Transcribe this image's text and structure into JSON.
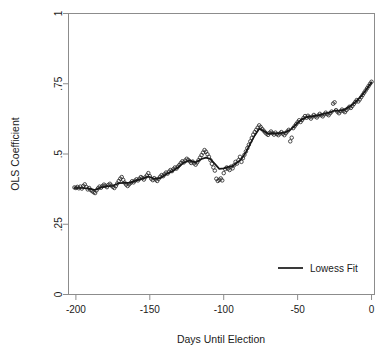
{
  "chart_data": {
    "type": "scatter",
    "title": "",
    "xlabel": "Days Until Election",
    "ylabel": "OLS Coefficient",
    "xlim": [
      -205,
      2
    ],
    "ylim": [
      0,
      1
    ],
    "xticks": [
      -200,
      -150,
      -100,
      -50,
      0
    ],
    "xticklabels": [
      "-200",
      "-150",
      "-100",
      "-50",
      "0"
    ],
    "yticks": [
      0,
      0.25,
      0.5,
      0.75,
      1
    ],
    "yticklabels": [
      "0",
      ".25",
      ".5",
      ".75",
      "1"
    ],
    "grid": false,
    "legend": {
      "position": "bottom-right",
      "entries": [
        {
          "label": "Lowess Fit",
          "marker": "line",
          "color": "#171717"
        }
      ]
    },
    "series": [
      {
        "name": "OLS coefficient estimates",
        "type": "scatter",
        "marker": "open-circle",
        "color": "#2b2b2b",
        "points": [
          [
            -201,
            0.381
          ],
          [
            -200,
            0.379
          ],
          [
            -199,
            0.383
          ],
          [
            -198,
            0.378
          ],
          [
            -197,
            0.384
          ],
          [
            -196,
            0.377
          ],
          [
            -195,
            0.386
          ],
          [
            -194,
            0.392
          ],
          [
            -193,
            0.383
          ],
          [
            -192,
            0.374
          ],
          [
            -191,
            0.379
          ],
          [
            -190,
            0.372
          ],
          [
            -189,
            0.368
          ],
          [
            -188,
            0.364
          ],
          [
            -187,
            0.361
          ],
          [
            -186,
            0.371
          ],
          [
            -185,
            0.378
          ],
          [
            -184,
            0.384
          ],
          [
            -183,
            0.38
          ],
          [
            -182,
            0.386
          ],
          [
            -181,
            0.391
          ],
          [
            -180,
            0.387
          ],
          [
            -179,
            0.382
          ],
          [
            -178,
            0.39
          ],
          [
            -177,
            0.394
          ],
          [
            -176,
            0.388
          ],
          [
            -175,
            0.383
          ],
          [
            -174,
            0.379
          ],
          [
            -173,
            0.386
          ],
          [
            -172,
            0.395
          ],
          [
            -171,
            0.404
          ],
          [
            -170,
            0.412
          ],
          [
            -169,
            0.418
          ],
          [
            -168,
            0.408
          ],
          [
            -167,
            0.398
          ],
          [
            -166,
            0.391
          ],
          [
            -165,
            0.386
          ],
          [
            -164,
            0.392
          ],
          [
            -163,
            0.397
          ],
          [
            -162,
            0.403
          ],
          [
            -161,
            0.399
          ],
          [
            -160,
            0.405
          ],
          [
            -159,
            0.41
          ],
          [
            -158,
            0.406
          ],
          [
            -157,
            0.412
          ],
          [
            -156,
            0.418
          ],
          [
            -155,
            0.414
          ],
          [
            -154,
            0.409
          ],
          [
            -153,
            0.417
          ],
          [
            -152,
            0.424
          ],
          [
            -151,
            0.432
          ],
          [
            -150,
            0.421
          ],
          [
            -149,
            0.412
          ],
          [
            -148,
            0.407
          ],
          [
            -147,
            0.414
          ],
          [
            -146,
            0.409
          ],
          [
            -145,
            0.404
          ],
          [
            -144,
            0.412
          ],
          [
            -143,
            0.419
          ],
          [
            -142,
            0.425
          ],
          [
            -141,
            0.421
          ],
          [
            -140,
            0.428
          ],
          [
            -139,
            0.434
          ],
          [
            -138,
            0.43
          ],
          [
            -137,
            0.437
          ],
          [
            -136,
            0.443
          ],
          [
            -135,
            0.439
          ],
          [
            -134,
            0.446
          ],
          [
            -133,
            0.452
          ],
          [
            -132,
            0.448
          ],
          [
            -131,
            0.455
          ],
          [
            -130,
            0.461
          ],
          [
            -129,
            0.468
          ],
          [
            -128,
            0.474
          ],
          [
            -127,
            0.47
          ],
          [
            -126,
            0.477
          ],
          [
            -125,
            0.483
          ],
          [
            -124,
            0.479
          ],
          [
            -123,
            0.474
          ],
          [
            -122,
            0.468
          ],
          [
            -121,
            0.473
          ],
          [
            -120,
            0.467
          ],
          [
            -119,
            0.462
          ],
          [
            -118,
            0.47
          ],
          [
            -117,
            0.478
          ],
          [
            -116,
            0.487
          ],
          [
            -115,
            0.496
          ],
          [
            -114,
            0.505
          ],
          [
            -113,
            0.514
          ],
          [
            -112,
            0.508
          ],
          [
            -111,
            0.499
          ],
          [
            -110,
            0.49
          ],
          [
            -109,
            0.478
          ],
          [
            -108,
            0.465
          ],
          [
            -107,
            0.452
          ],
          [
            -106,
            0.441
          ],
          [
            -105,
            0.412
          ],
          [
            -104,
            0.404
          ],
          [
            -103,
            0.408
          ],
          [
            -102,
            0.413
          ],
          [
            -101,
            0.406
          ],
          [
            -100,
            0.432
          ],
          [
            -99,
            0.446
          ],
          [
            -98,
            0.452
          ],
          [
            -97,
            0.448
          ],
          [
            -96,
            0.443
          ],
          [
            -95,
            0.455
          ],
          [
            -94,
            0.449
          ],
          [
            -93,
            0.46
          ],
          [
            -92,
            0.472
          ],
          [
            -91,
            0.466
          ],
          [
            -90,
            0.478
          ],
          [
            -89,
            0.49
          ],
          [
            -88,
            0.472
          ],
          [
            -87,
            0.485
          ],
          [
            -86,
            0.497
          ],
          [
            -85,
            0.509
          ],
          [
            -84,
            0.521
          ],
          [
            -83,
            0.533
          ],
          [
            -82,
            0.545
          ],
          [
            -81,
            0.557
          ],
          [
            -80,
            0.569
          ],
          [
            -79,
            0.578
          ],
          [
            -78,
            0.586
          ],
          [
            -77,
            0.594
          ],
          [
            -76,
            0.602
          ],
          [
            -75,
            0.596
          ],
          [
            -74,
            0.589
          ],
          [
            -73,
            0.583
          ],
          [
            -72,
            0.577
          ],
          [
            -71,
            0.572
          ],
          [
            -70,
            0.568
          ],
          [
            -69,
            0.575
          ],
          [
            -68,
            0.58
          ],
          [
            -67,
            0.574
          ],
          [
            -66,
            0.569
          ],
          [
            -65,
            0.576
          ],
          [
            -64,
            0.571
          ],
          [
            -63,
            0.567
          ],
          [
            -62,
            0.573
          ],
          [
            -61,
            0.578
          ],
          [
            -60,
            0.572
          ],
          [
            -59,
            0.567
          ],
          [
            -58,
            0.574
          ],
          [
            -57,
            0.58
          ],
          [
            -56,
            0.586
          ],
          [
            -55,
            0.545
          ],
          [
            -54,
            0.558
          ],
          [
            -53,
            0.592
          ],
          [
            -52,
            0.599
          ],
          [
            -51,
            0.606
          ],
          [
            -50,
            0.613
          ],
          [
            -49,
            0.62
          ],
          [
            -48,
            0.614
          ],
          [
            -47,
            0.621
          ],
          [
            -46,
            0.628
          ],
          [
            -45,
            0.635
          ],
          [
            -44,
            0.629
          ],
          [
            -43,
            0.636
          ],
          [
            -42,
            0.631
          ],
          [
            -41,
            0.626
          ],
          [
            -40,
            0.633
          ],
          [
            -39,
            0.639
          ],
          [
            -38,
            0.634
          ],
          [
            -37,
            0.63
          ],
          [
            -36,
            0.637
          ],
          [
            -35,
            0.643
          ],
          [
            -34,
            0.638
          ],
          [
            -33,
            0.634
          ],
          [
            -32,
            0.641
          ],
          [
            -31,
            0.647
          ],
          [
            -30,
            0.642
          ],
          [
            -29,
            0.638
          ],
          [
            -28,
            0.645
          ],
          [
            -27,
            0.651
          ],
          [
            -26,
            0.679
          ],
          [
            -25,
            0.684
          ],
          [
            -24,
            0.656
          ],
          [
            -23,
            0.65
          ],
          [
            -22,
            0.645
          ],
          [
            -21,
            0.652
          ],
          [
            -20,
            0.658
          ],
          [
            -19,
            0.653
          ],
          [
            -18,
            0.649
          ],
          [
            -17,
            0.656
          ],
          [
            -16,
            0.662
          ],
          [
            -15,
            0.668
          ],
          [
            -14,
            0.664
          ],
          [
            -13,
            0.671
          ],
          [
            -12,
            0.678
          ],
          [
            -11,
            0.685
          ],
          [
            -10,
            0.692
          ],
          [
            -9,
            0.687
          ],
          [
            -8,
            0.694
          ],
          [
            -7,
            0.702
          ],
          [
            -6,
            0.71
          ],
          [
            -5,
            0.718
          ],
          [
            -4,
            0.726
          ],
          [
            -3,
            0.734
          ],
          [
            -2,
            0.742
          ],
          [
            -1,
            0.75
          ],
          [
            0,
            0.757
          ]
        ]
      },
      {
        "name": "Lowess Fit",
        "type": "line",
        "color": "#171717",
        "points": [
          [
            -201,
            0.379
          ],
          [
            -196,
            0.379
          ],
          [
            -191,
            0.377
          ],
          [
            -187,
            0.372
          ],
          [
            -183,
            0.381
          ],
          [
            -179,
            0.385
          ],
          [
            -175,
            0.387
          ],
          [
            -171,
            0.396
          ],
          [
            -167,
            0.397
          ],
          [
            -163,
            0.398
          ],
          [
            -159,
            0.406
          ],
          [
            -155,
            0.412
          ],
          [
            -151,
            0.42
          ],
          [
            -147,
            0.412
          ],
          [
            -143,
            0.414
          ],
          [
            -139,
            0.428
          ],
          [
            -135,
            0.438
          ],
          [
            -131,
            0.452
          ],
          [
            -127,
            0.469
          ],
          [
            -123,
            0.477
          ],
          [
            -119,
            0.47
          ],
          [
            -115,
            0.482
          ],
          [
            -112,
            0.487
          ],
          [
            -109,
            0.482
          ],
          [
            -106,
            0.465
          ],
          [
            -103,
            0.447
          ],
          [
            -100,
            0.449
          ],
          [
            -97,
            0.454
          ],
          [
            -94,
            0.457
          ],
          [
            -91,
            0.469
          ],
          [
            -88,
            0.482
          ],
          [
            -85,
            0.506
          ],
          [
            -82,
            0.537
          ],
          [
            -79,
            0.566
          ],
          [
            -76,
            0.59
          ],
          [
            -73,
            0.582
          ],
          [
            -70,
            0.572
          ],
          [
            -67,
            0.574
          ],
          [
            -64,
            0.573
          ],
          [
            -61,
            0.575
          ],
          [
            -58,
            0.578
          ],
          [
            -55,
            0.586
          ],
          [
            -52,
            0.6
          ],
          [
            -49,
            0.616
          ],
          [
            -46,
            0.626
          ],
          [
            -43,
            0.633
          ],
          [
            -40,
            0.634
          ],
          [
            -37,
            0.637
          ],
          [
            -34,
            0.64
          ],
          [
            -31,
            0.645
          ],
          [
            -28,
            0.648
          ],
          [
            -25,
            0.655
          ],
          [
            -22,
            0.654
          ],
          [
            -19,
            0.657
          ],
          [
            -16,
            0.665
          ],
          [
            -13,
            0.676
          ],
          [
            -10,
            0.69
          ],
          [
            -7,
            0.706
          ],
          [
            -4,
            0.726
          ],
          [
            -1,
            0.748
          ],
          [
            0,
            0.755
          ]
        ]
      }
    ]
  },
  "axes": {
    "x_title": "Days Until Election",
    "y_title": "OLS Coefficient"
  },
  "legend": {
    "fit_label": "Lowess Fit"
  }
}
